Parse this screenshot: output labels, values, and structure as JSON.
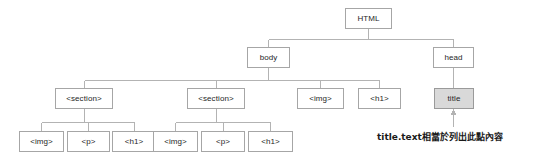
{
  "diagram": {
    "colors": {
      "background": "#ffffff",
      "box_border": "#a6a6a6",
      "box_fill": "#ffffff",
      "highlight_fill": "#d9d9d9",
      "edge": "#b3b3b3",
      "text": "#262626",
      "annotation_text": "#1a1a1a"
    },
    "nodes": [
      {
        "id": "html",
        "label": "HTML",
        "x": 345,
        "y": 8,
        "w": 47,
        "h": 21,
        "highlight": false
      },
      {
        "id": "body",
        "label": "body",
        "x": 247,
        "y": 47,
        "w": 43,
        "h": 21,
        "highlight": false
      },
      {
        "id": "head",
        "label": "head",
        "x": 433,
        "y": 47,
        "w": 41,
        "h": 21,
        "highlight": false
      },
      {
        "id": "section1",
        "label": "<section>",
        "x": 55,
        "y": 88,
        "w": 58,
        "h": 21,
        "highlight": false
      },
      {
        "id": "section2",
        "label": "<section>",
        "x": 187,
        "y": 88,
        "w": 58,
        "h": 21,
        "highlight": false
      },
      {
        "id": "img-body",
        "label": "<img>",
        "x": 297,
        "y": 88,
        "w": 47,
        "h": 21,
        "highlight": false
      },
      {
        "id": "h1-body",
        "label": "<h1>",
        "x": 358,
        "y": 88,
        "w": 43,
        "h": 21,
        "highlight": false
      },
      {
        "id": "title",
        "label": "title",
        "x": 434,
        "y": 88,
        "w": 40,
        "h": 21,
        "highlight": true
      },
      {
        "id": "img-s1",
        "label": "<img>",
        "x": 19,
        "y": 131,
        "w": 45,
        "h": 21,
        "highlight": false
      },
      {
        "id": "p-s1",
        "label": "<p>",
        "x": 67,
        "y": 131,
        "w": 43,
        "h": 21,
        "highlight": false
      },
      {
        "id": "h1-s1",
        "label": "<h1>",
        "x": 112,
        "y": 131,
        "w": 44,
        "h": 21,
        "highlight": false
      },
      {
        "id": "img-s2",
        "label": "<img>",
        "x": 153,
        "y": 131,
        "w": 45,
        "h": 21,
        "highlight": false
      },
      {
        "id": "p-s2",
        "label": "<p>",
        "x": 201,
        "y": 131,
        "w": 44,
        "h": 21,
        "highlight": false
      },
      {
        "id": "h1-s2",
        "label": "<h1>",
        "x": 248,
        "y": 131,
        "w": 45,
        "h": 21,
        "highlight": false
      }
    ],
    "edges": [
      {
        "from": "html",
        "to": "body"
      },
      {
        "from": "html",
        "to": "head"
      },
      {
        "from": "body",
        "to": "section1"
      },
      {
        "from": "body",
        "to": "section2"
      },
      {
        "from": "body",
        "to": "img-body"
      },
      {
        "from": "body",
        "to": "h1-body"
      },
      {
        "from": "head",
        "to": "title"
      },
      {
        "from": "section1",
        "to": "img-s1"
      },
      {
        "from": "section1",
        "to": "p-s1"
      },
      {
        "from": "section1",
        "to": "h1-s1"
      },
      {
        "from": "section2",
        "to": "img-s2"
      },
      {
        "from": "section2",
        "to": "p-s2"
      },
      {
        "from": "section2",
        "to": "h1-s2"
      }
    ],
    "annotation": {
      "text": "title.text相當於列出此點內容",
      "x": 377,
      "y": 130,
      "arrow": {
        "x": 454,
        "y_from": 127,
        "y_to": 111
      }
    }
  }
}
